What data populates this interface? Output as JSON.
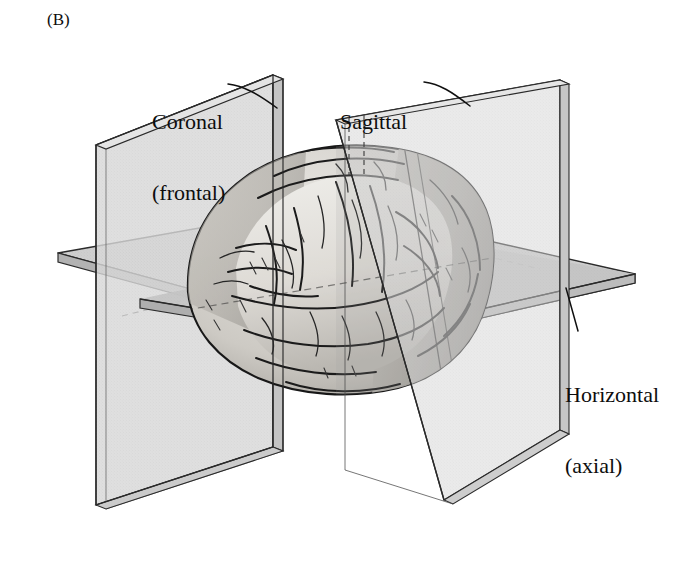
{
  "figure": {
    "panel_letter": "(B)",
    "kind": "anatomical-planes-diagram",
    "background_color": "#ffffff",
    "ink_color": "#0d0d0d"
  },
  "labels": {
    "coronal": {
      "line1": "Coronal",
      "line2": "(frontal)"
    },
    "sagittal": {
      "line1": "Sagittal",
      "line2": ""
    },
    "horizontal": {
      "line1": "Horizontal",
      "line2": "(axial)"
    }
  },
  "planes": [
    {
      "name": "coronal",
      "display_name": "Coronal (frontal)",
      "orientation": "vertical, facing left-right",
      "fill": "#d8d8d8",
      "edge": "#bdbdbd",
      "stroke": "#2a2a2a"
    },
    {
      "name": "sagittal",
      "display_name": "Sagittal",
      "orientation": "vertical, facing front-back",
      "fill": "#dcdcdc",
      "edge": "#c2c2c2",
      "stroke": "#2a2a2a"
    },
    {
      "name": "horizontal",
      "display_name": "Horizontal (axial)",
      "orientation": "horizontal slab",
      "fill": "#cfcfcf",
      "edge": "#b5b5b5",
      "stroke": "#2a2a2a"
    }
  ],
  "brain": {
    "label": "brain",
    "cortex_light": "#e2e0dc",
    "cortex_mid": "#b9b6b1",
    "cortex_shadow": "#8d8a86",
    "outline": "#171717"
  },
  "leader_lines": {
    "coronal": {
      "from_x": 228,
      "from_y": 85,
      "to_x": 276,
      "to_y": 107
    },
    "sagittal": {
      "from_x": 424,
      "from_y": 83,
      "to_x": 468,
      "to_y": 105
    },
    "horizontal": {
      "from_x": 578,
      "from_y": 332,
      "to_x": 566,
      "to_y": 288
    }
  }
}
